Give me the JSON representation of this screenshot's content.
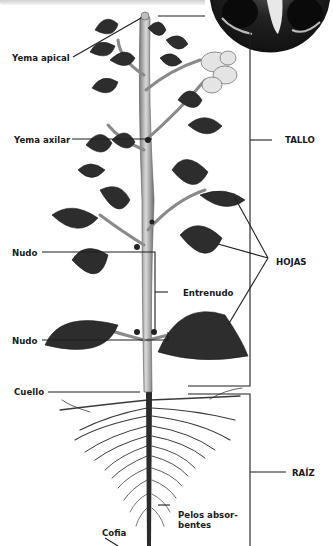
{
  "diagram": {
    "labels": {
      "yema_apical": "Yema apical",
      "yema_axilar": "Yema axilar",
      "nudo_superior": "Nudo",
      "nudo_inferior": "Nudo",
      "entrenudo": "Entrenudo",
      "cuello": "Cuello",
      "pelos_line1": "Pelos absor-",
      "pelos_line2": "bentes",
      "cofia": "Cofia",
      "tallo": "TALLO",
      "hojas": "HOJAS",
      "raiz": "RAÍZ"
    },
    "inset_photo": "flower-closeup-photo",
    "colors": {
      "leaf": "#2b2b2b",
      "stem": "#a8a8a8",
      "line": "#222222",
      "background": "#ffffff"
    }
  }
}
